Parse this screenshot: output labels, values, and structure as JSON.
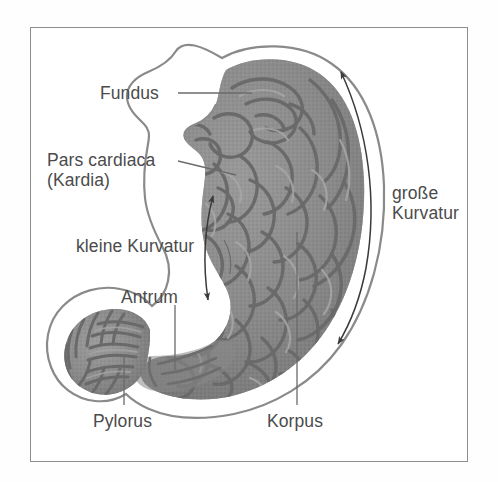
{
  "figure": {
    "kind": "anatomical-illustration",
    "language": "de",
    "frame": {
      "border_color": "#8d8d8d",
      "background": "#ffffff"
    },
    "palette": {
      "background": "#ffffff",
      "wall_fill": "#ffffff",
      "wall_outline": "#8a8a8a",
      "mucosa_light": "#9b9b9b",
      "mucosa_mid": "#858585",
      "mucosa_dark": "#656565",
      "rugae_stroke": "#6d6d6d",
      "label_text": "#4b4b4b",
      "leader_line": "#6b6b6b",
      "arrow": "#3a3a3a"
    }
  },
  "labels": [
    {
      "id": "fundus",
      "text": "Fundus",
      "marker": "leader-line"
    },
    {
      "id": "pars",
      "text": "Pars cardiaca",
      "text2": "(Kardia)",
      "marker": "leader-line"
    },
    {
      "id": "kleine",
      "text": "kleine Kurvatur",
      "marker": "double-arrow"
    },
    {
      "id": "antrum",
      "text": "Antrum",
      "marker": "leader-line"
    },
    {
      "id": "pylorus",
      "text": "Pylorus",
      "marker": "leader-line"
    },
    {
      "id": "korpus",
      "text": "Korpus",
      "marker": "leader-line"
    },
    {
      "id": "grosse",
      "text": "große",
      "text2": "Kurvatur",
      "marker": "double-arrow"
    }
  ]
}
